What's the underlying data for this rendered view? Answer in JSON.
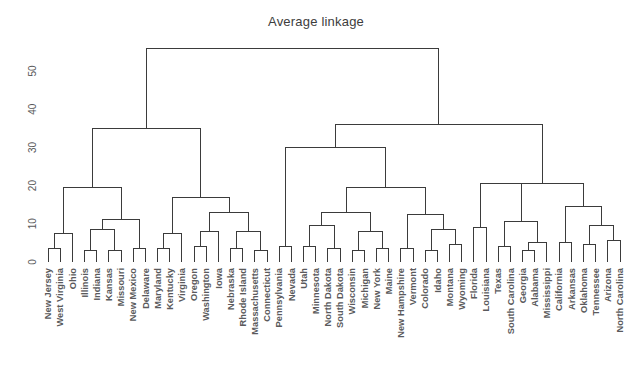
{
  "chart_data": {
    "type": "dendrogram",
    "title": "Average linkage",
    "xlabel": "",
    "ylabel": "",
    "ylim": [
      0,
      56
    ],
    "yticks": [
      0,
      10,
      20,
      30,
      40,
      50
    ],
    "ytick_labels": [
      "0",
      "10",
      "20",
      "30",
      "40",
      "50"
    ],
    "grid": false,
    "legend": "none",
    "linkage_method": "average",
    "n_leaves": 50,
    "leaf_labels": [
      "New Jersey",
      "West Virginia",
      "Ohio",
      "Illinois",
      "Indiana",
      "Kansas",
      "Missouri",
      "New Mexico",
      "Delaware",
      "Maryland",
      "Kentucky",
      "Virginia",
      "Oregon",
      "Washington",
      "Iowa",
      "Nebraska",
      "Rhode Island",
      "Massachusetts",
      "Connecticut",
      "Pennsylvania",
      "Nevada",
      "Utah",
      "Minnesota",
      "North Dakota",
      "South Dakota",
      "Wisconsin",
      "Michigan",
      "New York",
      "Maine",
      "New Hampshire",
      "Vermont",
      "Colorado",
      "Idaho",
      "Montana",
      "Wyoming",
      "Florida",
      "Louisiana",
      "Texas",
      "South Carolina",
      "Georgia",
      "Alabama",
      "Mississippi",
      "California",
      "Arkansas",
      "Oklahoma",
      "Tennessee",
      "Arizona",
      "North Carolina"
    ],
    "merges": [
      {
        "id": "m1",
        "left": "New Jersey",
        "right": "West Virginia",
        "height": 3.5
      },
      {
        "id": "m2",
        "left": "m1",
        "right": "Ohio",
        "height": 7.5
      },
      {
        "id": "m3",
        "left": "Illinois",
        "right": "Indiana",
        "height": 3.0
      },
      {
        "id": "m4",
        "left": "Kansas",
        "right": "Missouri",
        "height": 3.0
      },
      {
        "id": "m5",
        "left": "m3",
        "right": "m4",
        "height": 8.5
      },
      {
        "id": "m6",
        "left": "New Mexico",
        "right": "Delaware",
        "height": 3.5
      },
      {
        "id": "m7",
        "left": "m5",
        "right": "m6",
        "height": 11.0
      },
      {
        "id": "m8",
        "left": "m2",
        "right": "m7",
        "height": 19.5
      },
      {
        "id": "m9",
        "left": "Maryland",
        "right": "Kentucky",
        "height": 3.5
      },
      {
        "id": "m10",
        "left": "m9",
        "right": "Virginia",
        "height": 7.5
      },
      {
        "id": "m11",
        "left": "Oregon",
        "right": "Washington",
        "height": 4.0
      },
      {
        "id": "m12",
        "left": "m11",
        "right": "Iowa",
        "height": 8.0
      },
      {
        "id": "m13",
        "left": "Nebraska",
        "right": "Rhode Island",
        "height": 3.5
      },
      {
        "id": "m14",
        "left": "Massachusetts",
        "right": "Connecticut",
        "height": 3.0
      },
      {
        "id": "m15",
        "left": "m13",
        "right": "m14",
        "height": 8.0
      },
      {
        "id": "m16",
        "left": "m12",
        "right": "m15",
        "height": 13.0
      },
      {
        "id": "m17",
        "left": "m10",
        "right": "m16",
        "height": 17.0
      },
      {
        "id": "m18",
        "left": "m8",
        "right": "m17",
        "height": 35.0
      },
      {
        "id": "m19",
        "left": "Pennsylvania",
        "right": "Nevada",
        "height": 4.0
      },
      {
        "id": "m20",
        "left": "Utah",
        "right": "Minnesota",
        "height": 4.0
      },
      {
        "id": "m21",
        "left": "North Dakota",
        "right": "South Dakota",
        "height": 3.5
      },
      {
        "id": "m22",
        "left": "m20",
        "right": "m21",
        "height": 9.5
      },
      {
        "id": "m23",
        "left": "Wisconsin",
        "right": "Michigan",
        "height": 3.0
      },
      {
        "id": "m24",
        "left": "New York",
        "right": "Maine",
        "height": 3.5
      },
      {
        "id": "m25",
        "left": "m23",
        "right": "m24",
        "height": 8.0
      },
      {
        "id": "m26",
        "left": "m22",
        "right": "m25",
        "height": 13.0
      },
      {
        "id": "m27",
        "left": "New Hampshire",
        "right": "Vermont",
        "height": 3.5
      },
      {
        "id": "m28",
        "left": "Colorado",
        "right": "Idaho",
        "height": 3.0
      },
      {
        "id": "m29",
        "left": "Montana",
        "right": "Wyoming",
        "height": 4.5
      },
      {
        "id": "m30",
        "left": "m28",
        "right": "m29",
        "height": 8.5
      },
      {
        "id": "m31",
        "left": "m27",
        "right": "m30",
        "height": 12.5
      },
      {
        "id": "m32",
        "left": "m26",
        "right": "m31",
        "height": 19.5
      },
      {
        "id": "m33",
        "left": "m19",
        "right": "m32",
        "height": 30.0
      },
      {
        "id": "m34",
        "left": "Florida",
        "right": "Louisiana",
        "height": 9.0
      },
      {
        "id": "m35",
        "left": "Texas",
        "right": "South Carolina",
        "height": 4.0
      },
      {
        "id": "m36",
        "left": "Georgia",
        "right": "Alabama",
        "height": 3.0
      },
      {
        "id": "m37",
        "left": "m36",
        "right": "Mississippi",
        "height": 5.0
      },
      {
        "id": "m38",
        "left": "m35",
        "right": "m37",
        "height": 10.5
      },
      {
        "id": "m39",
        "left": "m34",
        "right": "m38",
        "height": 20.5
      },
      {
        "id": "m40",
        "left": "California",
        "right": "Arkansas",
        "height": 5.0
      },
      {
        "id": "m41",
        "left": "Oklahoma",
        "right": "Tennessee",
        "height": 4.5
      },
      {
        "id": "m42",
        "left": "Arizona",
        "right": "North Carolina",
        "height": 5.5
      },
      {
        "id": "m43",
        "left": "m41",
        "right": "m42",
        "height": 9.5
      },
      {
        "id": "m44",
        "left": "m40",
        "right": "m43",
        "height": 14.5
      },
      {
        "id": "m45",
        "left": "m39",
        "right": "m44",
        "height": 20.5
      },
      {
        "id": "m46",
        "left": "m33",
        "right": "m45",
        "height": 36.0
      },
      {
        "id": "m47",
        "left": "m18",
        "right": "m46",
        "height": 56.0
      }
    ],
    "colors": {
      "line": "#3b3b3b",
      "text": "#5a5a5c",
      "background": "#ffffff"
    }
  }
}
